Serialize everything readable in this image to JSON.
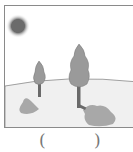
{
  "illustration": {
    "description": "Sun in upper-left, two trees on a hill with shadows cast to the lower left/right",
    "colors": {
      "sun": "#6b6b6b",
      "tree": "#9a9a9a",
      "trunk": "#6a6a6a",
      "shadow": "#a8a8a8",
      "ground": "#f0f0f0",
      "border": "#8a8a8a"
    }
  },
  "answer": {
    "open_paren": "(",
    "close_paren": ")",
    "value": ""
  }
}
